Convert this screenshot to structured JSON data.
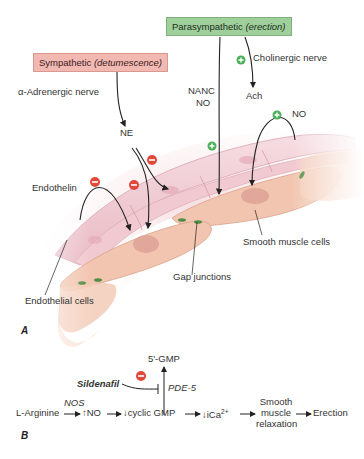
{
  "panel_a": {
    "letter": "A",
    "parasympathetic": {
      "title": "Parasympathetic",
      "note": "(erection)",
      "color": "#9fd09c"
    },
    "sympathetic": {
      "title": "Sympathetic",
      "note": "(detumescence)",
      "color": "#f2b8b2"
    },
    "labels": {
      "cholinergic": "Cholinergic nerve",
      "ach": "Ach",
      "nanc": "NANC",
      "nanc_no": "NO",
      "no": "NO",
      "alpha_adrenergic": "α-Adrenergic nerve",
      "ne": "NE",
      "endothelin": "Endothelin",
      "smooth_muscle_cells": "Smooth muscle cells",
      "gap_junctions": "Gap junctions",
      "endothelial_cells": "Endothelial cells"
    },
    "symbols": {
      "plus_color": "#4caf5a",
      "minus_color": "#e0483c"
    }
  },
  "panel_b": {
    "letter": "B",
    "gmp": "5'-GMP",
    "sildenafil": "Sildenafil",
    "pde5": "PDE-5",
    "nos": "NOS",
    "pathway": {
      "arginine": "L-Arginine",
      "no": "↑NO",
      "cgmp": "↓cyclic GMP",
      "ica": "↓iCa",
      "ica_sup": "2+",
      "smc_1": "Smooth",
      "smc_2": "muscle",
      "smc_3": "relaxation",
      "erection": "Erection"
    }
  }
}
